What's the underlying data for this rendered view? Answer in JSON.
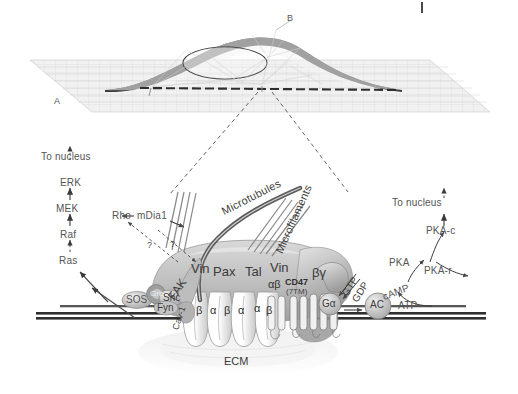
{
  "figure": {
    "cell_panel": {
      "label_a": "A",
      "label_b": "B"
    },
    "mapk_cascade": {
      "to_nucleus": "To nucleus",
      "steps": [
        "ERK",
        "MEK",
        "Raf",
        "Ras"
      ]
    },
    "pka_cascade": {
      "to_nucleus": "To nucleus",
      "pka_c": "PKA-c",
      "pka": "PKA",
      "pka_r": "PKA-r",
      "camp": "cAMP",
      "atp": "ATP",
      "ac": "AC"
    },
    "rho_module": {
      "rho": "Rho",
      "mdia1": "mDia1",
      "question_left": "?",
      "question_right": "?"
    },
    "cytoskeleton": {
      "microtubules": "Microtubules",
      "microfilaments": "Microfilaments"
    },
    "membrane_proteins": {
      "sos": "SOS",
      "grb2": "Grb2",
      "shc": "Shc",
      "fyn": "Fyn",
      "fak": "FAK",
      "cav1": "Cav-1"
    },
    "adhesion_plaque": {
      "vinculin_left": "Vin",
      "paxillin": "Pax",
      "talin": "Tal",
      "vinculin_right": "Vin",
      "integrin_pair": "αβ",
      "cd47": "CD47",
      "cd47_sub": "(7TM)",
      "g_beta_gamma": "βγ",
      "g_alpha": "Gα"
    },
    "integrin_subunits": [
      "β",
      "α",
      "β",
      "α",
      "α",
      "β"
    ],
    "nucleotides": {
      "gtp": "GTP",
      "gdp": "GDP"
    },
    "matrix": {
      "ecm": "ECM"
    },
    "colors": {
      "ink": "#2b2b2b",
      "mid_gray": "#6f6f6f",
      "light_gray": "#d8d8d8",
      "plaque_fill": "#c9c9c9",
      "membrane": "#3a3a3a",
      "substrate": "#e2e2e2"
    }
  }
}
